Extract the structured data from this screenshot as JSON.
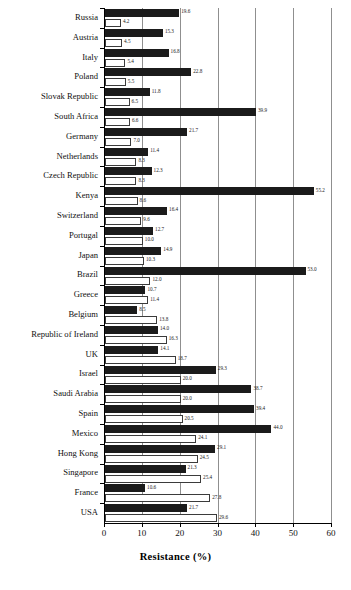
{
  "chart_data": {
    "type": "bar",
    "orientation": "horizontal",
    "title": "",
    "xlabel": "Resistance (%)",
    "ylabel": "",
    "xlim": [
      0,
      60
    ],
    "xticks": [
      0,
      10,
      20,
      30,
      40,
      50,
      60
    ],
    "grid": true,
    "legend": "none",
    "categories": [
      "Russia",
      "Austria",
      "Italy",
      "Poland",
      "Slovak Republic",
      "South Africa",
      "Germany",
      "Netherlands",
      "Czech Republic",
      "Kenya",
      "Switzerland",
      "Portugal",
      "Japan",
      "Brazil",
      "Greece",
      "Belgium",
      "Republic of Ireland",
      "UK",
      "Israel",
      "Saudi Arabia",
      "Spain",
      "Mexico",
      "Hong Kong",
      "Singapore",
      "France",
      "USA"
    ],
    "series": [
      {
        "name": "series-dark",
        "values": [
          19.6,
          15.3,
          16.8,
          22.8,
          11.8,
          39.9,
          21.7,
          11.4,
          12.3,
          55.2,
          16.4,
          12.7,
          14.9,
          53.0,
          10.7,
          8.5,
          14.0,
          14.1,
          29.3,
          38.7,
          39.4,
          44.0,
          29.1,
          21.3,
          10.6,
          21.7
        ]
      },
      {
        "name": "series-light",
        "values": [
          4.2,
          4.5,
          5.4,
          5.5,
          6.5,
          6.6,
          7.0,
          8.3,
          8.3,
          8.6,
          9.6,
          10.0,
          10.3,
          12.0,
          11.4,
          13.8,
          16.3,
          18.7,
          20.0,
          20.0,
          20.5,
          24.1,
          24.5,
          25.4,
          27.8,
          29.6
        ]
      }
    ]
  },
  "colors": {
    "dark_bar": "#1b1b1b",
    "light_bar_fill": "#ffffff",
    "light_bar_border": "#3b3b3b",
    "gridline": "#8f8f8f",
    "axis": "#000000"
  }
}
